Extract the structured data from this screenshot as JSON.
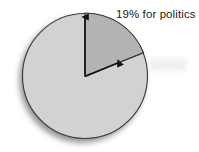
{
  "figure": {
    "background_color": "#ffffff",
    "annotation": {
      "text": "19% for politics",
      "color": "#1b1b1b"
    }
  },
  "chart_data": {
    "type": "pie",
    "title": "",
    "subtitle": "",
    "xlabel": "",
    "ylabel": "",
    "grid": false,
    "legend": "none",
    "annotations": [
      "19% for politics"
    ],
    "categories": [
      "for politics",
      "other"
    ],
    "values": [
      19,
      81
    ],
    "labels": [
      "19% for politics",
      ""
    ],
    "value_suffix": "%",
    "slice_colors": [
      "#b3b3b3",
      "#d2d2d2"
    ],
    "outline_color": "#3a3a3a",
    "start_angle_deg": 90,
    "direction": "clockwise",
    "center": {
      "x": 85,
      "y": 76
    },
    "radius": 63,
    "pointer_arrows": 2
  }
}
